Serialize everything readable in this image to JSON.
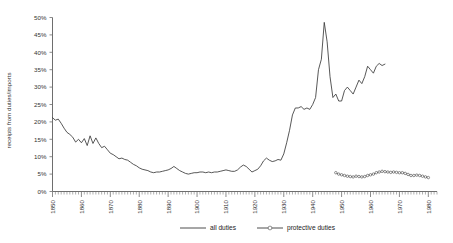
{
  "chart_data": {
    "type": "line",
    "title": "",
    "xlabel": "",
    "ylabel": "receipts from duties/imports",
    "xlim": [
      1850,
      1983
    ],
    "ylim": [
      0,
      0.5
    ],
    "grid": false,
    "legend_position": "bottom",
    "y_tick_labels": [
      "0%",
      "5%",
      "10%",
      "15%",
      "20%",
      "25%",
      "30%",
      "35%",
      "40%",
      "45%",
      "50%"
    ],
    "y_tick_values": [
      0,
      0.05,
      0.1,
      0.15,
      0.2,
      0.25,
      0.3,
      0.35,
      0.4,
      0.45,
      0.5
    ],
    "x_tick_labels": [
      "1850",
      "1860",
      "1870",
      "1880",
      "1890",
      "1900",
      "1910",
      "1920",
      "1930",
      "1940",
      "1950",
      "1960",
      "1970",
      "1980"
    ],
    "x_tick_values": [
      1850,
      1860,
      1870,
      1880,
      1890,
      1900,
      1910,
      1920,
      1930,
      1940,
      1950,
      1960,
      1970,
      1980
    ],
    "x_minor_tick_step": 1,
    "colors": {
      "all_duties": "#3a3a3a",
      "protective_duties": "#3a3a3a",
      "axis": "#6e6e6e",
      "text": "#333333"
    },
    "series": [
      {
        "name": "all duties",
        "marker": "none",
        "x": [
          1850,
          1851,
          1852,
          1853,
          1854,
          1855,
          1856,
          1857,
          1858,
          1859,
          1860,
          1861,
          1862,
          1863,
          1864,
          1865,
          1866,
          1867,
          1868,
          1869,
          1870,
          1871,
          1872,
          1873,
          1874,
          1875,
          1876,
          1877,
          1878,
          1879,
          1880,
          1881,
          1882,
          1883,
          1884,
          1885,
          1886,
          1887,
          1888,
          1889,
          1890,
          1891,
          1892,
          1893,
          1894,
          1895,
          1896,
          1897,
          1898,
          1899,
          1900,
          1901,
          1902,
          1903,
          1904,
          1905,
          1906,
          1907,
          1908,
          1909,
          1910,
          1911,
          1912,
          1913,
          1914,
          1915,
          1916,
          1917,
          1918,
          1919,
          1920,
          1921,
          1922,
          1923,
          1924,
          1925,
          1926,
          1927,
          1928,
          1929,
          1930,
          1931,
          1932,
          1933,
          1934,
          1935,
          1936,
          1937,
          1938,
          1939,
          1940,
          1941,
          1942,
          1943,
          1944,
          1945,
          1946,
          1947,
          1948,
          1949,
          1950,
          1951,
          1952,
          1953,
          1954,
          1955,
          1956,
          1957,
          1958,
          1959,
          1960,
          1961,
          1962,
          1963,
          1964,
          1965
        ],
        "values": [
          21.2,
          20.5,
          20.8,
          19.6,
          18.2,
          17.0,
          16.4,
          15.6,
          14.2,
          15.0,
          14.0,
          15.2,
          13.2,
          16.0,
          13.8,
          15.4,
          13.8,
          12.6,
          13.0,
          12.0,
          11.0,
          10.6,
          10.0,
          9.4,
          9.6,
          9.2,
          9.0,
          8.4,
          7.8,
          7.4,
          6.8,
          6.4,
          6.2,
          6.0,
          5.6,
          5.4,
          5.6,
          5.6,
          5.8,
          6.0,
          6.2,
          6.6,
          7.2,
          6.6,
          6.0,
          5.6,
          5.2,
          5.0,
          5.2,
          5.4,
          5.4,
          5.6,
          5.6,
          5.4,
          5.6,
          5.4,
          5.6,
          5.6,
          5.8,
          6.0,
          6.2,
          6.0,
          5.8,
          5.8,
          6.2,
          7.0,
          7.6,
          7.2,
          6.4,
          5.6,
          6.0,
          6.4,
          7.4,
          8.8,
          9.6,
          9.0,
          8.6,
          8.8,
          9.2,
          9.0,
          10.8,
          14.0,
          17.6,
          22.0,
          24.0,
          24.0,
          24.4,
          23.6,
          24.0,
          23.6,
          25.0,
          27.0,
          35.0,
          38.0,
          48.6,
          43.0,
          33.0,
          27.0,
          28.0,
          26.0,
          26.0,
          29.0,
          30.0,
          29.0,
          28.0,
          30.0,
          32.0,
          31.0,
          33.0,
          36.0,
          35.0,
          34.0,
          36.0,
          36.8,
          36.2,
          36.6
        ]
      },
      {
        "name": "protective duties",
        "marker": "circle",
        "x": [
          1948,
          1949,
          1950,
          1951,
          1952,
          1953,
          1954,
          1955,
          1956,
          1957,
          1958,
          1959,
          1960,
          1961,
          1962,
          1963,
          1964,
          1965,
          1966,
          1967,
          1968,
          1969,
          1970,
          1971,
          1972,
          1973,
          1974,
          1975,
          1976,
          1977,
          1978,
          1979,
          1980
        ],
        "values": [
          5.4,
          5.0,
          4.8,
          4.6,
          4.4,
          4.3,
          4.2,
          4.4,
          4.3,
          4.2,
          4.3,
          4.6,
          4.8,
          5.0,
          5.4,
          5.6,
          5.8,
          5.7,
          5.6,
          5.5,
          5.6,
          5.5,
          5.4,
          5.4,
          5.2,
          4.9,
          4.6,
          4.6,
          4.7,
          4.6,
          4.4,
          4.2,
          4.0
        ]
      }
    ]
  },
  "legend": {
    "items": [
      {
        "label": "all duties",
        "marker": "none"
      },
      {
        "label": "protective duties",
        "marker": "circle"
      }
    ]
  },
  "axes": {
    "y_title": "receipts from duties/imports"
  }
}
